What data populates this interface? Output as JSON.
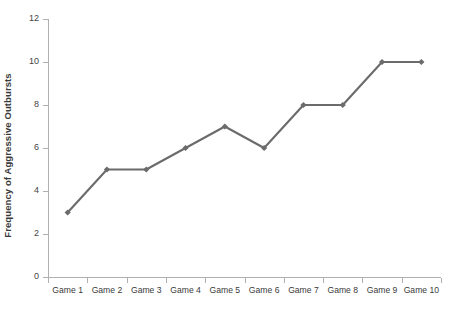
{
  "chart_data": {
    "type": "line",
    "title": "",
    "subtitle": "",
    "xlabel": "",
    "ylabel": "Frequency of Aggressive Outbursts",
    "categories": [
      "Game 1",
      "Game 2",
      "Game 3",
      "Game 4",
      "Game 5",
      "Game 6",
      "Game 7",
      "Game 8",
      "Game 9",
      "Game 10"
    ],
    "values": [
      3,
      5,
      5,
      6,
      7,
      6,
      8,
      8,
      10,
      10
    ],
    "series": [
      {
        "name": "Frequency of Aggressive Outbursts",
        "values": [
          3,
          5,
          5,
          6,
          7,
          6,
          8,
          8,
          10,
          10
        ],
        "color": "#6b6b6b",
        "marker": "diamond"
      }
    ],
    "ylim": [
      0,
      12
    ],
    "ytick_labels": [
      "0",
      "2",
      "4",
      "6",
      "8",
      "10",
      "12"
    ],
    "ytick_values": [
      0,
      2,
      4,
      6,
      8,
      10,
      12
    ],
    "grid": false,
    "legend": false,
    "legend_position": "none",
    "background_color": "#ffffff",
    "axis_color": "#b0b0b0",
    "text_color": "#3a3a3a"
  }
}
